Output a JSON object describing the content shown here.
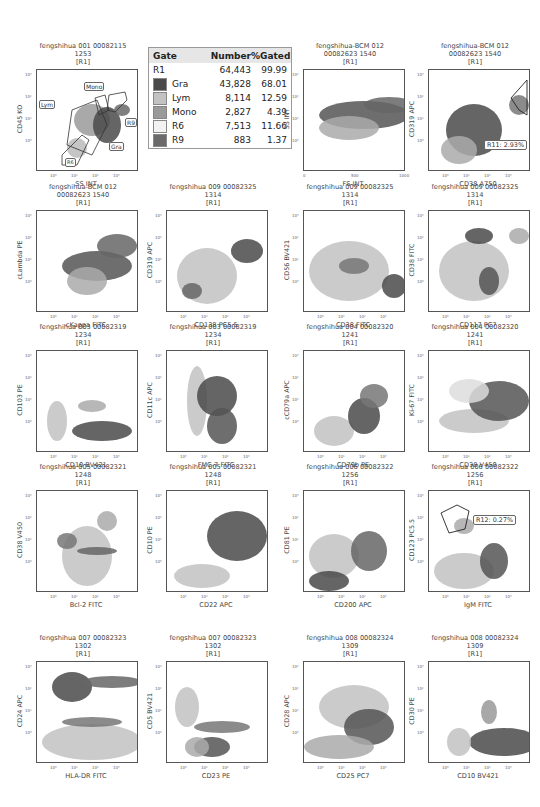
{
  "legend": {
    "headers": {
      "gate": "Gate",
      "number": "Number",
      "pct": "%Gated"
    },
    "rows": [
      {
        "gate": "R1",
        "number": "64,443",
        "pct": "99.99",
        "swatch": null
      },
      {
        "gate": "Gra",
        "number": "43,828",
        "pct": "68.01",
        "swatch": "#4a4a4a"
      },
      {
        "gate": "Lym",
        "number": "8,114",
        "pct": "12.59",
        "swatch": "#c2c2c2"
      },
      {
        "gate": "Mono",
        "number": "2,827",
        "pct": "4.39",
        "swatch": "#9a9a9a"
      },
      {
        "gate": "R6",
        "number": "7,513",
        "pct": "11.66",
        "swatch": "#f2f2f2"
      },
      {
        "gate": "R9",
        "number": "883",
        "pct": "1.37",
        "swatch": "#6a6a6a"
      }
    ]
  },
  "chart_data": [
    {
      "type": "scatter",
      "title": "fengshihua 001 00082115\n1253\n[R1]",
      "xlabel": "SS INT",
      "ylabel": "CD45 KO",
      "xscale": "log",
      "xticks": [
        "10⁰",
        "10¹",
        "10²",
        "10³"
      ],
      "yticks": [
        "10⁰",
        "10¹",
        "10²",
        "10³"
      ],
      "gates": [
        "Lym",
        "Mono",
        "R9",
        "Gra",
        "R6"
      ]
    },
    {
      "type": "scatter",
      "title": "fengshihua-BCM 012\n00082623 1540\n[R1]",
      "xlabel": "FS INT",
      "ylabel": "SS INT",
      "xticks": [
        "0",
        "500",
        "1000"
      ],
      "yticks": [
        "10⁰",
        "10¹",
        "10²",
        "10³"
      ]
    },
    {
      "type": "scatter",
      "title": "fengshihua-BCM 012\n00082623 1540\n[R1]",
      "xlabel": "CD38 A750",
      "ylabel": "CD319 APC",
      "xticks": [
        "10⁰",
        "10¹",
        "10²",
        "10³"
      ],
      "yticks": [
        "10⁰",
        "10¹",
        "10²",
        "10³"
      ],
      "stat": "R11: 2.93%"
    },
    {
      "type": "scatter",
      "title": "fengshihua-BCM 012\n00082623 1540\n[R1]",
      "xlabel": "cKappa FITC",
      "ylabel": "cLambda PE",
      "xticks": [
        "10⁰",
        "10¹",
        "10²",
        "10³"
      ],
      "yticks": [
        "10⁰",
        "10¹",
        "10²",
        "10³"
      ]
    },
    {
      "type": "scatter",
      "title": "fengshihua 009 00082325\n1314\n[R1]",
      "xlabel": "CD138 PC5.5",
      "ylabel": "CD319 APC",
      "xticks": [
        "10⁰",
        "10¹",
        "10²",
        "10³"
      ],
      "yticks": [
        "10⁰",
        "10¹",
        "10²",
        "10³"
      ]
    },
    {
      "type": "scatter",
      "title": "fengshihua 009 00082325\n1314\n[R1]",
      "xlabel": "CD38  FITC",
      "ylabel": "CD56 BV421",
      "xticks": [
        "10⁰",
        "10¹",
        "10²",
        "10³"
      ],
      "yticks": [
        "10⁰",
        "10¹",
        "10²",
        "10³"
      ]
    },
    {
      "type": "scatter",
      "title": "fengshihua 009 00082325\n1314\n[R1]",
      "xlabel": "CD117 PC7",
      "ylabel": "CD38  FITC",
      "xticks": [
        "10⁰",
        "10¹",
        "10²",
        "10³"
      ],
      "yticks": [
        "10⁰",
        "10¹",
        "10²",
        "10³"
      ]
    },
    {
      "type": "scatter",
      "title": "fengshihua 003 00082319\n1234\n[R1]",
      "xlabel": "CD10 BV421",
      "ylabel": "CD103 PE",
      "xticks": [
        "10⁰",
        "10¹",
        "10²",
        "10³"
      ],
      "yticks": [
        "10⁰",
        "10¹",
        "10²",
        "10³"
      ]
    },
    {
      "type": "scatter",
      "title": "fengshihua 003 00082319\n1234\n[R1]",
      "xlabel": "FMC-7 FITC",
      "ylabel": "CD11c APC",
      "xticks": [
        "10⁰",
        "10¹",
        "10²",
        "10³"
      ],
      "yticks": [
        "10⁰",
        "10¹",
        "10²",
        "10³"
      ]
    },
    {
      "type": "scatter",
      "title": "fengshihua 004 00082320\n1241\n[R1]",
      "xlabel": "CD79b PE",
      "ylabel": "cCD79a APC",
      "xticks": [
        "10⁰",
        "10¹",
        "10²",
        "10³"
      ],
      "yticks": [
        "10⁰",
        "10¹",
        "10²",
        "10³"
      ]
    },
    {
      "type": "scatter",
      "title": "fengshihua 004 00082320\n1241\n[R1]",
      "xlabel": "CD38 V450",
      "ylabel": "Ki-67 FITC",
      "xticks": [
        "10⁰",
        "10¹",
        "10²",
        "10³"
      ],
      "yticks": [
        "10⁰",
        "10¹",
        "10²",
        "10³"
      ]
    },
    {
      "type": "scatter",
      "title": "fengshihua 005 00082321\n1248\n[R1]",
      "xlabel": "Bcl-2 FITC",
      "ylabel": "CD38 V450",
      "xticks": [
        "10⁰",
        "10¹",
        "10²",
        "10³"
      ],
      "yticks": [
        "10⁰",
        "10¹",
        "10²",
        "10³"
      ]
    },
    {
      "type": "scatter",
      "title": "fengshihua 005 00082321\n1248\n[R1]",
      "xlabel": "CD22 APC",
      "ylabel": "CD10 PE",
      "xticks": [
        "10⁰",
        "10¹",
        "10²",
        "10³"
      ],
      "yticks": [
        "10⁰",
        "10¹",
        "10²",
        "10³"
      ]
    },
    {
      "type": "scatter",
      "title": "fengshihua 006 00082322\n1256\n[R1]",
      "xlabel": "CD200 APC",
      "ylabel": "CD81 PE",
      "xticks": [
        "10⁰",
        "10¹",
        "10²",
        "10³"
      ],
      "yticks": [
        "10⁰",
        "10¹",
        "10²",
        "10³"
      ]
    },
    {
      "type": "scatter",
      "title": "fengshihua 006 00082322\n1256\n[R1]",
      "xlabel": "IgM FITC",
      "ylabel": "CD123 PC5.5",
      "xticks": [
        "10⁰",
        "10¹",
        "10²",
        "10³"
      ],
      "yticks": [
        "10⁰",
        "10¹",
        "10²",
        "10³"
      ],
      "stat": "R12: 0.27%"
    },
    {
      "type": "scatter",
      "title": "fengshihua 007 00082323\n1302\n[R1]",
      "xlabel": "HLA-DR FITC",
      "ylabel": "CD24 APC",
      "xticks": [
        "10⁰",
        "10¹",
        "10²",
        "10³"
      ],
      "yticks": [
        "10⁰",
        "10¹",
        "10²",
        "10³"
      ]
    },
    {
      "type": "scatter",
      "title": "fengshihua 007 00082323\n1302\n[R1]",
      "xlabel": "CD23 PE",
      "ylabel": "CD5 BV421",
      "xticks": [
        "10⁰",
        "10¹",
        "10²",
        "10³"
      ],
      "yticks": [
        "10⁰",
        "10¹",
        "10²",
        "10³"
      ]
    },
    {
      "type": "scatter",
      "title": "fengshihua 008 00082324\n1309\n[R1]",
      "xlabel": "CD25 PC7",
      "ylabel": "CD28 APC",
      "xticks": [
        "10⁰",
        "10¹",
        "10²",
        "10³"
      ],
      "yticks": [
        "10⁰",
        "10¹",
        "10²",
        "10³"
      ]
    },
    {
      "type": "scatter",
      "title": "fengshihua 008 00082324\n1309\n[R1]",
      "xlabel": "CD10 BV421",
      "ylabel": "CD30 PE",
      "xticks": [
        "10⁰",
        "10¹",
        "10²",
        "10³"
      ],
      "yticks": [
        "10⁰",
        "10¹",
        "10²",
        "10³"
      ]
    }
  ],
  "panels": [
    {
      "t1": "fengshihua 001 00082115",
      "t2": "1253",
      "t3": "[R1]",
      "x": "SS INT",
      "y": "CD45 KO"
    },
    {
      "t1": "fengshihua-BCM 012",
      "t2": "00082623 1540",
      "t3": "[R1]",
      "x": "FS INT",
      "y": "SS INT"
    },
    {
      "t1": "fengshihua-BCM 012",
      "t2": "00082623 1540",
      "t3": "[R1]",
      "x": "CD38 A750",
      "y": "CD319 APC",
      "stat": "R11: 2.93%"
    },
    {
      "t1": "fengshihua-BCM 012",
      "t2": "00082623 1540",
      "t3": "[R1]",
      "x": "cKappa FITC",
      "y": "cLambda PE"
    },
    {
      "t1": "fengshihua 009 00082325",
      "t2": "1314",
      "t3": "[R1]",
      "x": "CD138 PC5.5",
      "y": "CD319 APC"
    },
    {
      "t1": "fengshihua 009 00082325",
      "t2": "1314",
      "t3": "[R1]",
      "x": "CD38  FITC",
      "y": "CD56 BV421"
    },
    {
      "t1": "fengshihua 009 00082325",
      "t2": "1314",
      "t3": "[R1]",
      "x": "CD117 PC7",
      "y": "CD38  FITC"
    },
    {
      "t1": "fengshihua 003 00082319",
      "t2": "1234",
      "t3": "[R1]",
      "x": "CD10 BV421",
      "y": "CD103 PE"
    },
    {
      "t1": "fengshihua 003 00082319",
      "t2": "1234",
      "t3": "[R1]",
      "x": "FMC-7 FITC",
      "y": "CD11c APC"
    },
    {
      "t1": "fengshihua 004 00082320",
      "t2": "1241",
      "t3": "[R1]",
      "x": "CD79b PE",
      "y": "cCD79a APC"
    },
    {
      "t1": "fengshihua 004 00082320",
      "t2": "1241",
      "t3": "[R1]",
      "x": "CD38 V450",
      "y": "Ki-67 FITC"
    },
    {
      "t1": "fengshihua 005 00082321",
      "t2": "1248",
      "t3": "[R1]",
      "x": "Bcl-2 FITC",
      "y": "CD38 V450"
    },
    {
      "t1": "fengshihua 005 00082321",
      "t2": "1248",
      "t3": "[R1]",
      "x": "CD22 APC",
      "y": "CD10 PE"
    },
    {
      "t1": "fengshihua 006 00082322",
      "t2": "1256",
      "t3": "[R1]",
      "x": "CD200 APC",
      "y": "CD81 PE"
    },
    {
      "t1": "fengshihua 006 00082322",
      "t2": "1256",
      "t3": "[R1]",
      "x": "IgM FITC",
      "y": "CD123 PC5.5",
      "stat": "R12: 0.27%"
    },
    {
      "t1": "fengshihua 007 00082323",
      "t2": "1302",
      "t3": "[R1]",
      "x": "HLA-DR FITC",
      "y": "CD24 APC"
    },
    {
      "t1": "fengshihua 007 00082323",
      "t2": "1302",
      "t3": "[R1]",
      "x": "CD23 PE",
      "y": "CD5 BV421"
    },
    {
      "t1": "fengshihua 008 00082324",
      "t2": "1309",
      "t3": "[R1]",
      "x": "CD25 PC7",
      "y": "CD28 APC"
    },
    {
      "t1": "fengshihua 008 00082324",
      "t2": "1309",
      "t3": "[R1]",
      "x": "CD10 BV421",
      "y": "CD30 PE"
    }
  ],
  "gate_labels": {
    "lym": "Lym",
    "mono": "Mono",
    "r9": "R9",
    "gra": "Gra",
    "r6": "R6"
  },
  "ticks": {
    "log": [
      "10⁰",
      "10¹",
      "10²",
      "10³"
    ],
    "ylog": [
      "10³",
      "10²",
      "10¹",
      "10⁰"
    ],
    "lin": [
      "0",
      "500",
      "1000"
    ]
  }
}
